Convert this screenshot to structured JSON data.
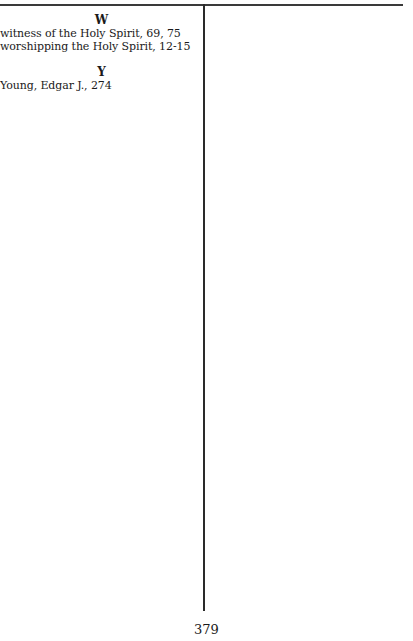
{
  "index": {
    "groups": [
      {
        "letter": "W",
        "entries": [
          "witness of the Holy Spirit, 69, 75",
          "worshipping the Holy Spirit, 12-15"
        ]
      },
      {
        "letter": "Y",
        "entries": [
          "Young, Edgar J., 274"
        ]
      }
    ]
  },
  "footer": {
    "page_number": "379"
  }
}
